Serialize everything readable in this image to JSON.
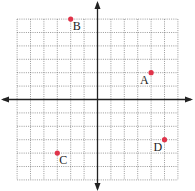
{
  "chart_data": {
    "type": "scatter",
    "title": "",
    "xlabel": "",
    "ylabel": "",
    "xlim": [
      -6,
      6
    ],
    "ylim": [
      -6,
      6
    ],
    "grid": true,
    "grid_style": "dotted",
    "axes_arrows": true,
    "point_color": "#e0344a",
    "points": [
      {
        "label": "A",
        "x": 4,
        "y": 2,
        "label_pos": "bottom-left"
      },
      {
        "label": "B",
        "x": -2,
        "y": 6,
        "label_pos": "bottom-right"
      },
      {
        "label": "C",
        "x": -3,
        "y": -4,
        "label_pos": "bottom-right"
      },
      {
        "label": "D",
        "x": 5,
        "y": -3,
        "label_pos": "bottom-left"
      }
    ]
  }
}
